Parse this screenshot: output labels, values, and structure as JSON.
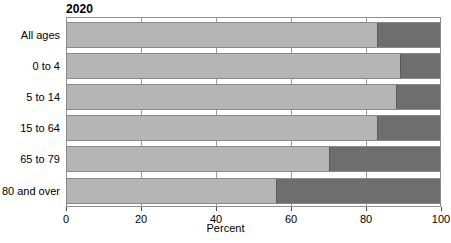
{
  "chart_data": {
    "type": "bar",
    "subtype": "stacked-horizontal-100-percent",
    "title": "2020",
    "xlabel": "Percent",
    "ylabel": "",
    "xlim": [
      0,
      100
    ],
    "xticks": [
      0,
      20,
      40,
      60,
      80,
      100
    ],
    "xtick_labels": [
      "0",
      "20",
      "40",
      "60",
      "80",
      "100"
    ],
    "grid": true,
    "legend": "none",
    "orientation": "horizontal",
    "categories": [
      "All ages",
      "0 to 4",
      "5 to 14",
      "15 to 64",
      "65 to 79",
      "80 and over"
    ],
    "series": [
      {
        "name": "segment-1",
        "color": "#b5b5b5",
        "values": [
          83,
          89,
          88,
          83,
          70,
          56
        ]
      },
      {
        "name": "segment-2",
        "color": "#6e6e6e",
        "values": [
          17,
          11,
          12,
          17,
          30,
          44
        ]
      }
    ],
    "colors": {
      "segment_light": "#b5b5b5",
      "segment_dark": "#6e6e6e",
      "axis": "#4a4a4a",
      "gridline": "#9a9a9a",
      "frame": "#8d8d8d",
      "text": "#000000",
      "background": "#ffffff"
    }
  }
}
